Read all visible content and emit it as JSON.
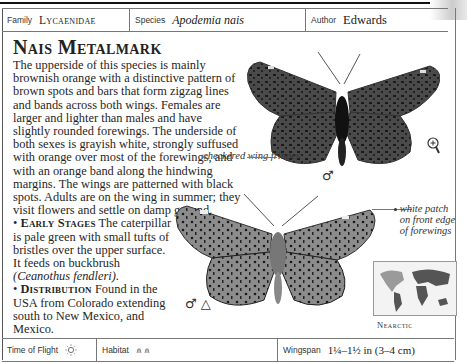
{
  "header": {
    "family_label": "Family",
    "family_value": "Lycaenidae",
    "species_label": "Species",
    "species_value": "Apodemia nais",
    "author_label": "Author",
    "author_value": "Edwards"
  },
  "entry": {
    "title": "Nais Metalmark",
    "description": "The upperside of this species is mainly brownish orange with a distinctive pattern of brown spots and bars that form zigzag lines and bands across both wings. Females are larger and lighter than males and have slightly rounded forewings. The underside of both sexes is grayish white, strongly suffused with orange over most of the forewings, and with an orange band along the hindwing margins. The wings are patterned with black spots. Adults are on the wing in summer; they visit flowers and settle on damp ground.",
    "early_stages_heading": "Early Stages",
    "early_stages_text": "The caterpillar is pale green with small tufts of bristles over the upper surface. It feeds on buckbrush",
    "early_stages_plant": "(Ceanothus fendleri).",
    "distribution_heading": "Distribution",
    "distribution_text": "Found in the USA from Colorado extending south to New Mexico, and Mexico."
  },
  "illustrations": {
    "upper_callout": "checkered wing fringes",
    "upper_symbol": "♂",
    "lower_callout": "white patch on front edge of forewings",
    "lower_symbols": "♂ △",
    "zoom_icon": "magnifier-plus"
  },
  "map": {
    "region_label": "Nearctic"
  },
  "footer": {
    "time_label": "Time of Flight",
    "time_icon": "sun-icon",
    "habitat_label": "Habitat",
    "habitat_icon": "grassland-icon",
    "wingspan_label": "Wingspan",
    "wingspan_value": "1¼–1½ in (3–4 cm)"
  }
}
